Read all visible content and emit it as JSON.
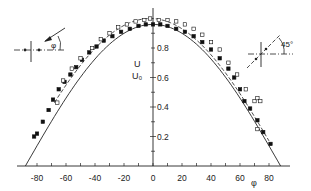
{
  "chart_data": {
    "type": "scatter",
    "title": "",
    "xlabel": "φ",
    "ylabel": "U/U₀",
    "ylabel_top": "U",
    "ylabel_bottom": "U₀",
    "xlim": [
      -90,
      90
    ],
    "ylim": [
      0,
      1.0
    ],
    "x_ticks": [
      -80,
      -60,
      -40,
      -20,
      0,
      20,
      40,
      60,
      80
    ],
    "x_tick_labels": [
      "-80",
      "-60",
      "-40",
      "-20",
      "0",
      "20",
      "40",
      "60",
      "80"
    ],
    "y_ticks": [
      0.2,
      0.4,
      0.6,
      0.8
    ],
    "y_tick_labels": [
      "0.2",
      "0.4",
      "0.6",
      "0.8"
    ],
    "grid": false,
    "series": [
      {
        "name": "filled markers (0° configuration)",
        "marker": "filled-square",
        "line": "solid",
        "points": [
          [
            -82,
            0.2
          ],
          [
            -80,
            0.22
          ],
          [
            -76,
            0.3
          ],
          [
            -72,
            0.38
          ],
          [
            -69,
            0.45
          ],
          [
            -65,
            0.52
          ],
          [
            -61,
            0.57
          ],
          [
            -57,
            0.62
          ],
          [
            -53,
            0.67
          ],
          [
            -49,
            0.72
          ],
          [
            -44,
            0.77
          ],
          [
            -39,
            0.81
          ],
          [
            -34,
            0.85
          ],
          [
            -28,
            0.88
          ],
          [
            -22,
            0.91
          ],
          [
            -16,
            0.93
          ],
          [
            -10,
            0.95
          ],
          [
            -5,
            0.96
          ],
          [
            0,
            0.96
          ],
          [
            5,
            0.96
          ],
          [
            10,
            0.95
          ],
          [
            16,
            0.93
          ],
          [
            22,
            0.91
          ],
          [
            28,
            0.88
          ],
          [
            34,
            0.84
          ],
          [
            40,
            0.79
          ],
          [
            46,
            0.73
          ],
          [
            52,
            0.66
          ],
          [
            56,
            0.6
          ],
          [
            60,
            0.52
          ],
          [
            63,
            0.44
          ],
          [
            67,
            0.39
          ],
          [
            72,
            0.31
          ],
          [
            76,
            0.23
          ],
          [
            81,
            0.15
          ]
        ],
        "fit_curve": "cos-like, zero near ±88°"
      },
      {
        "name": "open markers (45° configuration)",
        "marker": "open-square",
        "line": "dashed",
        "points": [
          [
            -66,
            0.43
          ],
          [
            -62,
            0.58
          ],
          [
            -56,
            0.66
          ],
          [
            -50,
            0.73
          ],
          [
            -42,
            0.8
          ],
          [
            -36,
            0.86
          ],
          [
            -30,
            0.9
          ],
          [
            -24,
            0.94
          ],
          [
            -18,
            0.96
          ],
          [
            -12,
            0.98
          ],
          [
            -6,
            0.99
          ],
          [
            -2,
            1.0
          ],
          [
            4,
            0.99
          ],
          [
            10,
            0.99
          ],
          [
            16,
            0.98
          ],
          [
            22,
            0.96
          ],
          [
            28,
            0.93
          ],
          [
            34,
            0.89
          ],
          [
            40,
            0.84
          ],
          [
            46,
            0.79
          ],
          [
            52,
            0.7
          ],
          [
            58,
            0.62
          ],
          [
            64,
            0.52
          ],
          [
            70,
            0.44
          ],
          [
            72,
            0.46
          ],
          [
            74,
            0.44
          ],
          [
            72,
            0.25
          ]
        ],
        "fit_curve": "dashed, narrower, peaks ≈1.0 near φ=0"
      }
    ],
    "annotations": [
      {
        "text": "φ",
        "location": "inset upper-left: flow arrow at angle φ to probe axis"
      },
      {
        "text": "45°",
        "location": "inset upper-right: probe rotated 45°"
      }
    ]
  },
  "insets": {
    "left": {
      "angle_label": "φ"
    },
    "right": {
      "angle_label": "45°"
    }
  }
}
